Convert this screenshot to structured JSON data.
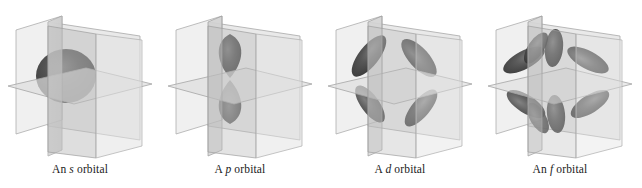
{
  "figure": {
    "background_color": "#ffffff",
    "panel_count": 4
  },
  "palette": {
    "background": "#ffffff",
    "plane_light": "#e3e3e3",
    "plane_mid": "#cfcfcf",
    "plane_dark": "#b4b4b4",
    "plane_edge": "#9a9a9a",
    "lobe_dark": "#3a3a3a",
    "lobe_mid": "#5e5e5e",
    "lobe_light": "#8d8d8d",
    "caption_color": "#1a1a1a"
  },
  "panels": [
    {
      "id": "s-orbital",
      "caption_prefix": "An ",
      "caption_letter": "s",
      "caption_suffix": " orbital",
      "caption_full": "An s orbital",
      "orbital_type": "s",
      "lobe_count": 1,
      "shape_description": "single sphere centered at origin",
      "planes": [
        "xy-horizontal",
        "yz-vertical",
        "xz-vertical"
      ]
    },
    {
      "id": "p-orbital",
      "caption_prefix": "A ",
      "caption_letter": "p",
      "caption_suffix": " orbital",
      "caption_full": "A p orbital",
      "orbital_type": "p",
      "lobe_count": 2,
      "shape_description": "two teardrop lobes along the vertical z-axis",
      "planes": [
        "xy-horizontal",
        "yz-vertical",
        "xz-vertical"
      ]
    },
    {
      "id": "d-orbital",
      "caption_prefix": "A ",
      "caption_letter": "d",
      "caption_suffix": " orbital",
      "caption_full": "A d orbital",
      "orbital_type": "d",
      "lobe_count": 4,
      "shape_description": "four-lobed cloverleaf arranged diagonally",
      "planes": [
        "xy-horizontal",
        "yz-vertical",
        "xz-vertical"
      ]
    },
    {
      "id": "f-orbital",
      "caption_prefix": "An ",
      "caption_letter": "f",
      "caption_suffix": " orbital",
      "caption_full": "An f orbital",
      "orbital_type": "f",
      "lobe_count": 8,
      "shape_description": "eight-lobed starburst radiating from origin",
      "planes": [
        "xy-horizontal",
        "yz-vertical",
        "xz-vertical"
      ]
    }
  ]
}
